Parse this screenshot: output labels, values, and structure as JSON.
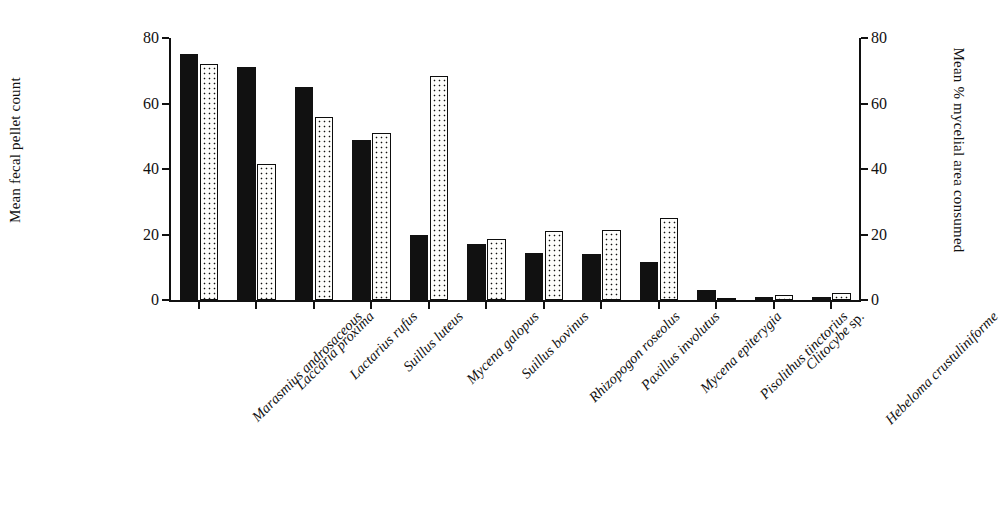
{
  "chart_data": {
    "type": "bar",
    "title": "",
    "categories": [
      "Marasmius androsaceous",
      "Laccaria proxima",
      "Lactarius rufus",
      "Suillus luteus",
      "Mycena galopus",
      "Suillus bovinus",
      "Rhizopogon roseolus",
      "Paxillus involutus",
      "Mycena epiterygia",
      "Pisolithus tinctorius",
      "Clitocybe sp.",
      "Hebeloma crustuliniforme"
    ],
    "series": [
      {
        "name": "Mean fecal pellet count",
        "fill": "solid-black",
        "axis": "left",
        "values": [
          75,
          71,
          65,
          49,
          20,
          17,
          14.5,
          14,
          11.5,
          3,
          1,
          1
        ]
      },
      {
        "name": "Mean % mycelial area consumed",
        "fill": "dotted-white",
        "axis": "right",
        "values": [
          72,
          41.5,
          56,
          51,
          68.5,
          18.5,
          21,
          21.5,
          25,
          0,
          1.5,
          2
        ]
      }
    ],
    "left_axis": {
      "label": "Mean fecal pellet count",
      "ticks": [
        0,
        20,
        40,
        60,
        80
      ],
      "ylim": [
        0,
        80
      ]
    },
    "right_axis": {
      "label": "Mean % mycelial area consumed",
      "ticks": [
        0,
        20,
        40,
        60,
        80
      ],
      "ylim": [
        0,
        80
      ]
    },
    "xlabel": "",
    "grid": false,
    "legend_position": "none",
    "label_rotation_degrees": -45
  },
  "colors": {
    "bar_solid": "#111111",
    "bar_dotted_fill": "#fdfdfb",
    "bar_dotted_dot": "#111111",
    "axis": "#111111",
    "background": "#ffffff",
    "text": "#111111"
  },
  "ticklabels": {
    "t0": "0",
    "t20": "20",
    "t40": "40",
    "t60": "60",
    "t80": "80"
  }
}
